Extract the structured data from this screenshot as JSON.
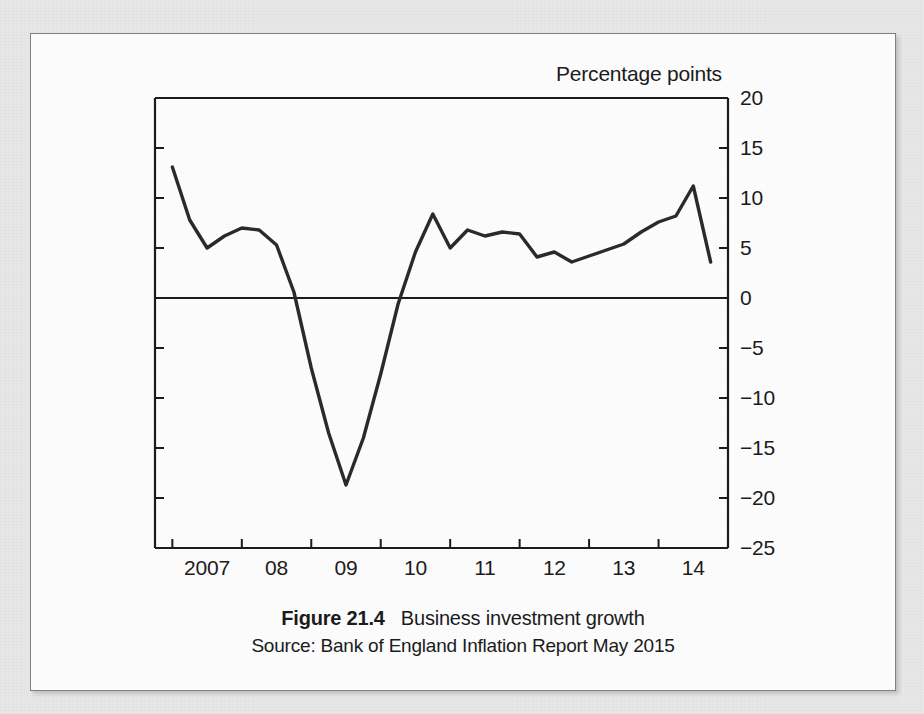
{
  "figure": {
    "caption_number": "Figure 21.4",
    "caption_title": "Business investment growth",
    "source": "Source: Bank of England Inflation Report May 2015"
  },
  "colors": {
    "page_background": "#e7e7e7",
    "figure_background": "#fcfcfc",
    "figure_border": "#7f8083",
    "axis": "#1b1b1b",
    "series_line": "#2a2a2a",
    "zero_line": "#1b1b1b",
    "text": "#1b1b1b"
  },
  "chart_data": {
    "type": "line",
    "title": "Business investment growth",
    "ylabel": "Percentage points",
    "xlabel": "",
    "ylim": [
      -25,
      20
    ],
    "ytick_values": [
      20,
      15,
      10,
      5,
      0,
      -5,
      -10,
      -15,
      -20,
      -25
    ],
    "ytick_labels": [
      "20",
      "15",
      "10",
      "5",
      "0",
      "−5",
      "−10",
      "−15",
      "−20",
      "−25"
    ],
    "yaxis_position": "right",
    "xlim": [
      2006.75,
      2015.0
    ],
    "xtick_values": [
      2007.0,
      2008.0,
      2009.0,
      2010.0,
      2011.0,
      2012.0,
      2013.0,
      2014.0,
      2015.0
    ],
    "xtick_labels": [
      "2007",
      "08",
      "09",
      "10",
      "11",
      "12",
      "13",
      "14"
    ],
    "xtick_label_positions": [
      2007.5,
      2008.5,
      2009.5,
      2010.5,
      2011.5,
      2012.5,
      2013.5,
      2014.5
    ],
    "grid": false,
    "legend": "none",
    "zero_line": 0,
    "series": [
      {
        "name": "Business investment growth",
        "x": [
          2007.0,
          2007.25,
          2007.5,
          2007.75,
          2008.0,
          2008.25,
          2008.5,
          2008.75,
          2009.0,
          2009.25,
          2009.5,
          2009.75,
          2010.0,
          2010.25,
          2010.5,
          2010.75,
          2011.0,
          2011.25,
          2011.5,
          2011.75,
          2012.0,
          2012.25,
          2012.5,
          2012.75,
          2013.0,
          2013.25,
          2013.5,
          2013.75,
          2014.0,
          2014.25,
          2014.5,
          2014.75
        ],
        "values": [
          13.1,
          7.8,
          5.0,
          6.2,
          7.0,
          6.8,
          5.3,
          0.6,
          -7.0,
          -13.5,
          -18.7,
          -14.0,
          -7.6,
          -0.6,
          4.6,
          8.4,
          5.0,
          6.8,
          6.2,
          6.6,
          6.4,
          4.1,
          4.6,
          3.6,
          4.2,
          4.8,
          5.4,
          6.6,
          7.6,
          8.2,
          11.2,
          3.6
        ]
      }
    ]
  }
}
